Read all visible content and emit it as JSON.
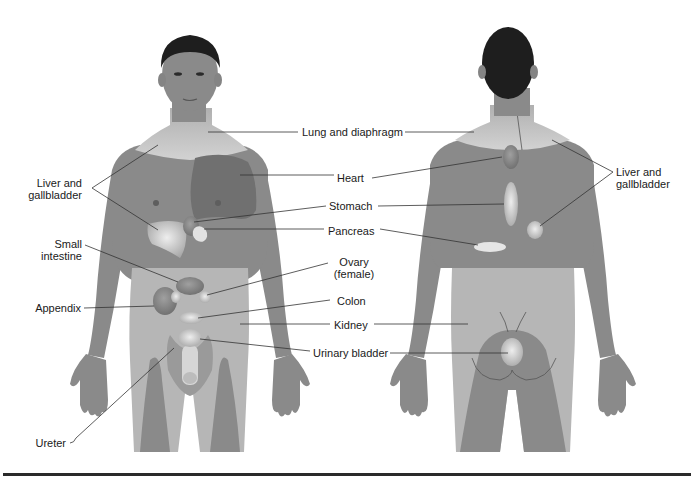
{
  "figure": {
    "colors": {
      "background": "#ffffff",
      "body_skin": "#8a8a8a",
      "body_dark": "#7a7a7a",
      "hair": "#1e1e1e",
      "lower_torso_light": "#b8b8b8",
      "neck_shoulder_light": "#c8c8c8",
      "organ_light": "#d8d8d8",
      "heart_area": "#6f6f6f",
      "leader_line": "#333333",
      "text": "#1a1a1a",
      "bottom_rule": "#2a2a2a"
    }
  },
  "labels": {
    "lung_and_diaphragm": "Lung and diaphragm",
    "heart": "Heart",
    "stomach": "Stomach",
    "pancreas": "Pancreas",
    "ovary_line1": "Ovary",
    "ovary_line2": "(female)",
    "colon": "Colon",
    "kidney": "Kidney",
    "urinary_bladder": "Urinary bladder",
    "liver_left_line1": "Liver and",
    "liver_left_line2": "gallbladder",
    "small_intestine_line1": "Small",
    "small_intestine_line2": "intestine",
    "appendix": "Appendix",
    "ureter": "Ureter",
    "liver_right_line1": "Liver and",
    "liver_right_line2": "gallbladder"
  },
  "views": [
    {
      "name": "anterior",
      "position": "left"
    },
    {
      "name": "posterior",
      "position": "right"
    }
  ]
}
